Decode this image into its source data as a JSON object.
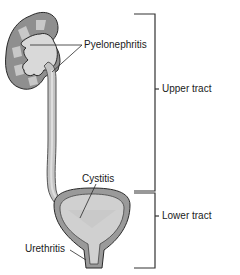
{
  "diagram": {
    "labels": {
      "pyelonephritis": "Pyelonephritis",
      "cystitis": "Cystitis",
      "urethritis": "Urethritis",
      "upper_tract": "Upper tract",
      "lower_tract": "Lower tract"
    },
    "structures": [
      "kidney",
      "ureter",
      "bladder",
      "urethra"
    ],
    "colors": {
      "outline": "#2a2a2a",
      "tissue_dark": "#8f8f8f",
      "tissue_mid": "#b8b8b8",
      "tissue_light": "#d9d9d9",
      "bracket": "#333333"
    }
  }
}
